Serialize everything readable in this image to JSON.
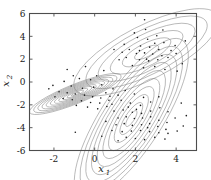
{
  "chart_data": {
    "type": "scatter",
    "title": "",
    "xlabel": "x1",
    "ylabel": "x2",
    "xlabel_base": "x",
    "xlabel_sub": "1",
    "ylabel_base": "x",
    "ylabel_sub": "2",
    "xlim": [
      -3.2,
      5.0
    ],
    "ylim": [
      -6,
      6
    ],
    "xticks": [
      -2,
      0,
      2,
      4
    ],
    "xticklabels": [
      "-2",
      "0",
      "2",
      "4"
    ],
    "yticks": [
      -6,
      -4,
      -2,
      0,
      2,
      4,
      6
    ],
    "yticklabels": [
      "-6",
      "-4",
      "-2",
      "0",
      "2",
      "4",
      "6"
    ],
    "grid": false,
    "legend": null,
    "box": true,
    "tick_direction": "in",
    "axis_color": "#4d4d4d",
    "contour_color": "#808080",
    "point_color": "#1a1a1a",
    "point_marker": "dot",
    "point_size": 1.3,
    "components": [
      {
        "name": "upper-right",
        "mean": [
          2.55,
          2.6
        ],
        "sigma_major": 1.55,
        "sigma_minor": 0.92,
        "angle_deg": -27,
        "levels": 6
      },
      {
        "name": "lower-right",
        "mean": [
          1.8,
          -3.2
        ],
        "sigma_major": 1.8,
        "sigma_minor": 1.05,
        "angle_deg": -57,
        "levels": 10
      },
      {
        "name": "left",
        "mean": [
          -0.95,
          -1.05
        ],
        "sigma_major": 0.95,
        "sigma_minor": 0.33,
        "angle_deg": -22,
        "levels": 11
      }
    ],
    "points": [
      [
        2.45,
        5.45
      ],
      [
        3.35,
        4.55
      ],
      [
        1.95,
        4.3
      ],
      [
        3.05,
        4.05
      ],
      [
        2.1,
        3.9
      ],
      [
        1.45,
        3.3
      ],
      [
        2.6,
        3.75
      ],
      [
        3.4,
        3.45
      ],
      [
        3.95,
        3.2
      ],
      [
        1.7,
        2.85
      ],
      [
        2.25,
        3.15
      ],
      [
        2.7,
        3.05
      ],
      [
        3.15,
        2.85
      ],
      [
        2.05,
        2.5
      ],
      [
        2.45,
        2.55
      ],
      [
        2.85,
        2.45
      ],
      [
        3.3,
        2.3
      ],
      [
        1.55,
        2.15
      ],
      [
        2.2,
        1.95
      ],
      [
        2.65,
        1.85
      ],
      [
        3.1,
        1.95
      ],
      [
        3.6,
        2.15
      ],
      [
        4.0,
        2.5
      ],
      [
        4.3,
        1.6
      ],
      [
        1.2,
        1.95
      ],
      [
        1.85,
        1.45
      ],
      [
        2.4,
        1.25
      ],
      [
        2.95,
        1.35
      ],
      [
        3.45,
        1.1
      ],
      [
        2.55,
        2.0
      ],
      [
        2.2,
        2.75
      ],
      [
        2.95,
        3.4
      ],
      [
        1.35,
        2.6
      ],
      [
        3.75,
        2.75
      ],
      [
        2.5,
        4.6
      ],
      [
        4.45,
        3.6
      ],
      [
        0.95,
        2.85
      ],
      [
        4.05,
        0.95
      ],
      [
        -0.45,
        1.35
      ],
      [
        -1.35,
        1.1
      ],
      [
        0.45,
        1.0
      ],
      [
        0.1,
        0.55
      ],
      [
        -0.2,
        0.2
      ],
      [
        -0.75,
        0.3
      ],
      [
        -1.5,
        0.05
      ],
      [
        -2.05,
        -0.3
      ],
      [
        -1.15,
        -0.35
      ],
      [
        -0.6,
        -0.55
      ],
      [
        -0.05,
        -0.45
      ],
      [
        0.35,
        -0.25
      ],
      [
        -1.75,
        -0.85
      ],
      [
        -1.35,
        -0.95
      ],
      [
        -0.95,
        -1.05
      ],
      [
        -0.5,
        -1.15
      ],
      [
        -0.1,
        -1.3
      ],
      [
        0.3,
        -1.4
      ],
      [
        -1.55,
        -1.45
      ],
      [
        -1.1,
        -1.55
      ],
      [
        -0.65,
        -1.65
      ],
      [
        -0.2,
        -1.8
      ],
      [
        0.25,
        -1.85
      ],
      [
        0.7,
        -1.6
      ],
      [
        -0.35,
        -2.2
      ],
      [
        0.15,
        -2.35
      ],
      [
        0.6,
        -2.15
      ],
      [
        -0.9,
        -2.05
      ],
      [
        0.55,
        -0.95
      ],
      [
        0.9,
        -0.6
      ],
      [
        1.15,
        -1.15
      ],
      [
        0.85,
        -1.95
      ],
      [
        -1.95,
        -1.3
      ],
      [
        -2.25,
        -0.6
      ],
      [
        -1.05,
        0.55
      ],
      [
        1.5,
        -0.75
      ],
      [
        1.95,
        -1.05
      ],
      [
        2.4,
        -1.35
      ],
      [
        1.3,
        -1.6
      ],
      [
        1.75,
        -1.85
      ],
      [
        2.25,
        -2.05
      ],
      [
        2.75,
        -1.75
      ],
      [
        3.15,
        -1.3
      ],
      [
        0.95,
        -2.55
      ],
      [
        1.4,
        -2.45
      ],
      [
        1.85,
        -2.65
      ],
      [
        2.3,
        -2.75
      ],
      [
        2.75,
        -2.55
      ],
      [
        3.2,
        -2.25
      ],
      [
        3.6,
        -2.6
      ],
      [
        1.15,
        -3.15
      ],
      [
        1.55,
        -3.05
      ],
      [
        1.95,
        -3.2
      ],
      [
        2.35,
        -3.15
      ],
      [
        2.75,
        -3.05
      ],
      [
        3.15,
        -3.35
      ],
      [
        3.55,
        -3.55
      ],
      [
        3.95,
        -3.15
      ],
      [
        1.05,
        -3.75
      ],
      [
        1.45,
        -3.65
      ],
      [
        1.85,
        -3.8
      ],
      [
        2.3,
        -3.75
      ],
      [
        2.7,
        -3.65
      ],
      [
        3.1,
        -3.9
      ],
      [
        3.5,
        -4.15
      ],
      [
        0.85,
        -4.25
      ],
      [
        1.35,
        -4.35
      ],
      [
        1.8,
        -4.3
      ],
      [
        2.25,
        -4.25
      ],
      [
        2.7,
        -4.35
      ],
      [
        3.15,
        -4.45
      ],
      [
        3.6,
        -4.5
      ],
      [
        4.05,
        -4.3
      ],
      [
        1.55,
        -4.85
      ],
      [
        2.0,
        -4.95
      ],
      [
        2.45,
        -5.05
      ],
      [
        2.95,
        -4.85
      ],
      [
        1.15,
        -5.15
      ],
      [
        3.45,
        -5.0
      ],
      [
        4.35,
        -3.85
      ],
      [
        4.5,
        -2.95
      ],
      [
        0.55,
        -3.45
      ],
      [
        -0.95,
        -4.4
      ],
      [
        0.35,
        -4.75
      ],
      [
        4.25,
        -1.85
      ],
      [
        2.05,
        -2.4
      ],
      [
        2.6,
        -4.0
      ],
      [
        1.65,
        -2.2
      ],
      [
        0.75,
        -1.25
      ]
    ]
  },
  "figure": {
    "background": "#ffffff",
    "width": 211,
    "height": 180
  }
}
